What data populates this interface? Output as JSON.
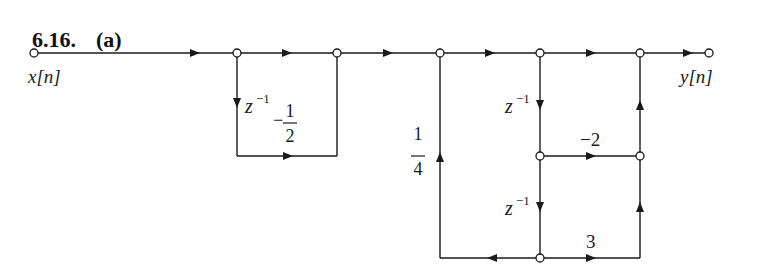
{
  "problem": {
    "number": "6.16.",
    "part": "(a)"
  },
  "signals": {
    "input": "x[n]",
    "output": "y[n]"
  },
  "gains": {
    "delay_1": "z",
    "delay_1_exp": "−1",
    "first_loop_gain_sign": "−",
    "first_loop_gain_num": "1",
    "first_loop_gain_den": "2",
    "feedback_gain_num": "1",
    "feedback_gain_den": "4",
    "delay_2": "z",
    "delay_2_exp": "−1",
    "delay_3": "z",
    "delay_3_exp": "−1",
    "mid_branch_gain": "−2",
    "bottom_branch_gain": "3"
  },
  "diagram": {
    "type": "signal-flow-graph",
    "nodes": [
      {
        "id": "in",
        "x": 34,
        "y": 53
      },
      {
        "id": "n1",
        "x": 237,
        "y": 53
      },
      {
        "id": "n2",
        "x": 337,
        "y": 53
      },
      {
        "id": "n3",
        "x": 440,
        "y": 53
      },
      {
        "id": "n4",
        "x": 540,
        "y": 53
      },
      {
        "id": "n5",
        "x": 640,
        "y": 53
      },
      {
        "id": "out",
        "x": 709,
        "y": 53
      },
      {
        "id": "n6",
        "x": 540,
        "y": 156
      },
      {
        "id": "n7",
        "x": 640,
        "y": 156
      },
      {
        "id": "n8",
        "x": 540,
        "y": 258
      }
    ],
    "edges": [
      {
        "from": "in",
        "to": "n1",
        "gain": "1"
      },
      {
        "from": "n1",
        "to": "n2",
        "gain": "1"
      },
      {
        "from": "n1",
        "to": "n2",
        "gain": "-1/2 z^-1",
        "path": "lower loop"
      },
      {
        "from": "n2",
        "to": "n3",
        "gain": "1"
      },
      {
        "from": "n3",
        "to": "n4",
        "gain": "1"
      },
      {
        "from": "n4",
        "to": "n5",
        "gain": "1"
      },
      {
        "from": "n5",
        "to": "out",
        "gain": "1"
      },
      {
        "from": "n4",
        "to": "n6",
        "gain": "z^-1"
      },
      {
        "from": "n6",
        "to": "n8",
        "gain": "z^-1"
      },
      {
        "from": "n6",
        "to": "n7",
        "gain": "-2"
      },
      {
        "from": "n7",
        "to": "n5",
        "gain": "1"
      },
      {
        "from": "n8",
        "to": "n7",
        "gain": "3",
        "path": "right then up"
      },
      {
        "from": "n8",
        "to": "n3",
        "gain": "1/4",
        "path": "left then up"
      }
    ]
  }
}
